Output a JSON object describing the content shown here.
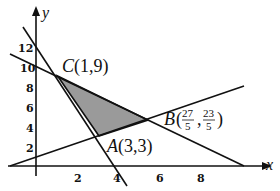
{
  "axes": {
    "x_label": "x",
    "y_label": "y",
    "x_ticks": [
      "2",
      "4",
      "6",
      "8"
    ],
    "y_ticks": [
      "2",
      "4",
      "6",
      "8",
      "10",
      "12"
    ]
  },
  "points": {
    "C": {
      "name": "C",
      "coords": "(1,9)"
    },
    "A": {
      "name": "A",
      "coords": "(3,3)"
    },
    "B": {
      "name": "B",
      "x_num": "27",
      "x_den": "5",
      "y_num": "23",
      "y_den": "5"
    }
  },
  "colors": {
    "shade": "#9a9a9a",
    "line": "#111111"
  }
}
